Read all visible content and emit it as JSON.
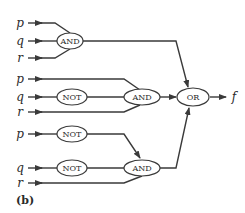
{
  "caption": "(b)",
  "output_label": "f",
  "inputs": {
    "group1": {
      "p": "p",
      "q": "q",
      "r": "r"
    },
    "group2": {
      "p": "p",
      "q": "q",
      "r": "r"
    },
    "group3": {
      "p": "p",
      "q": "q",
      "r": "r"
    }
  },
  "gates": {
    "and1": "AND",
    "not2": "NOT",
    "and2": "AND",
    "not3p": "NOT",
    "not3q": "NOT",
    "and3": "AND",
    "or": "OR"
  },
  "colors": {
    "line": "#3a3a3a",
    "text": "#2a2a2a",
    "background": "#ffffff"
  }
}
